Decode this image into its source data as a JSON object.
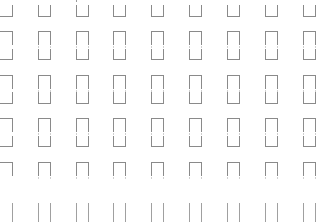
{
  "pattern": {
    "name": "bracket-grid-pattern",
    "line_color": "#8a8a8a",
    "background_color": "#ffffff",
    "columns": 9,
    "rows": [
      "cup",
      "cap",
      "cup",
      "cap",
      "cup",
      "cap",
      "cup",
      "cap",
      "legs"
    ]
  }
}
